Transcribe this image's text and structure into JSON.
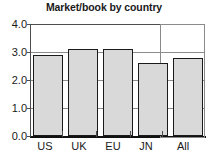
{
  "chart_data": {
    "type": "bar",
    "title": "Market/book by country",
    "xlabel": "",
    "ylabel": "",
    "categories": [
      "US",
      "UK",
      "EU",
      "JN",
      "All"
    ],
    "values": [
      2.9,
      3.1,
      3.12,
      2.6,
      2.8
    ],
    "ylim": [
      0.0,
      4.0
    ],
    "ytick_labels": [
      "0.0",
      "1.0",
      "2.0",
      "3.0",
      "4.0"
    ],
    "ytick_values": [
      0.0,
      1.0,
      2.0,
      3.0,
      4.0
    ],
    "grid": true,
    "grid_axis": "y",
    "legend": false,
    "legend_position": "none",
    "annotations": [
      {
        "name": "all-column-highlight",
        "type": "rectangle",
        "target_category": "All",
        "note": "Outlined box drawn around the 'All' column spanning full plot height"
      }
    ],
    "colors": {
      "bar_fill": "#d9d9d9",
      "bar_border": "#1a1a1a",
      "gridline": "#8c8c8c",
      "axis": "#111111",
      "highlight_box": "#8a8a8a",
      "text": "#1a1a1a",
      "background": "#ffffff"
    }
  }
}
